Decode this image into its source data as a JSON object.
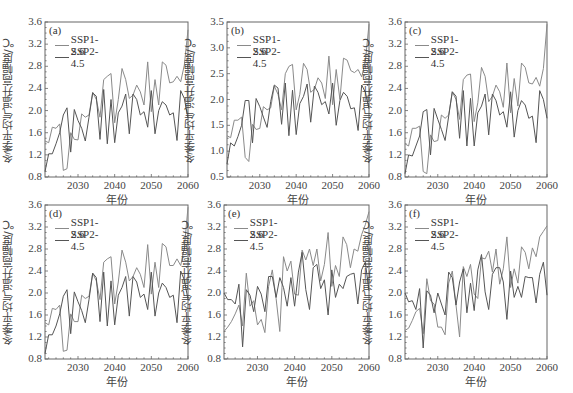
{
  "figure": {
    "xlabel": "年份",
    "ylabel": "冬季平均气温升高幅度/℃",
    "legend": [
      "SSP1-2.6",
      "SSP2-4.5"
    ],
    "line_colors": [
      "#8a8a8a",
      "#555555"
    ]
  },
  "chart_data": [
    {
      "panel": "(a)",
      "type": "line",
      "xlabel": "年份",
      "ylabel": "冬季平均气温升高幅度/℃",
      "xlim": [
        2021,
        2060
      ],
      "ylim": [
        0.8,
        3.6
      ],
      "xticks": [
        "2030",
        "2040",
        "2050",
        "2060"
      ],
      "yticks": [
        "0.8",
        "1.2",
        "1.6",
        "2.0",
        "2.4",
        "2.8",
        "3.2",
        "3.6"
      ],
      "x": [
        2021,
        2022,
        2023,
        2024,
        2025,
        2026,
        2027,
        2028,
        2029,
        2030,
        2031,
        2032,
        2033,
        2034,
        2035,
        2036,
        2037,
        2038,
        2039,
        2040,
        2041,
        2042,
        2043,
        2044,
        2045,
        2046,
        2047,
        2048,
        2049,
        2050,
        2051,
        2052,
        2053,
        2054,
        2055,
        2056,
        2057,
        2058,
        2059,
        2060
      ],
      "series": [
        {
          "name": "SSP1-2.6",
          "values": [
            1.45,
            1.42,
            1.7,
            1.68,
            1.76,
            0.92,
            0.95,
            1.6,
            1.48,
            1.47,
            1.94,
            1.88,
            1.92,
            2.33,
            2.2,
            1.88,
            2.56,
            2.62,
            2.67,
            1.78,
            2.2,
            2.76,
            2.56,
            2.22,
            2.28,
            2.46,
            2.34,
            2.1,
            2.88,
            1.98,
            2.56,
            2.1,
            2.88,
            2.82,
            2.5,
            2.52,
            2.62,
            2.52,
            2.82,
            3.46
          ]
        },
        {
          "name": "SSP2-4.5",
          "values": [
            0.9,
            1.22,
            1.22,
            1.4,
            1.6,
            1.92,
            2.05,
            1.25,
            2.02,
            1.82,
            1.68,
            1.45,
            1.88,
            2.32,
            2.26,
            1.48,
            2.38,
            1.4,
            2.2,
            1.42,
            1.96,
            2.08,
            2.3,
            1.58,
            2.3,
            2.2,
            1.92,
            1.98,
            1.7,
            2.36,
            1.58,
            2.0,
            2.16,
            2.1,
            1.92,
            1.96,
            1.46,
            2.36,
            2.22,
            1.86
          ]
        }
      ]
    },
    {
      "panel": "(b)",
      "type": "line",
      "xlabel": "年份",
      "ylabel": "冬季平均气温升高幅度/℃",
      "xlim": [
        2021,
        2060
      ],
      "ylim": [
        0.5,
        3.5
      ],
      "xticks": [
        "2030",
        "2040",
        "2050",
        "2060"
      ],
      "yticks": [
        "0.5",
        "1.0",
        "1.5",
        "2.0",
        "2.5",
        "3.0",
        "3.5"
      ],
      "x": [
        2021,
        2022,
        2023,
        2024,
        2025,
        2026,
        2027,
        2028,
        2029,
        2030,
        2031,
        2032,
        2033,
        2034,
        2035,
        2036,
        2037,
        2038,
        2039,
        2040,
        2041,
        2042,
        2043,
        2044,
        2045,
        2046,
        2047,
        2048,
        2049,
        2050,
        2051,
        2052,
        2053,
        2054,
        2055,
        2056,
        2057,
        2058,
        2059,
        2060
      ],
      "series": [
        {
          "name": "SSP1-2.6",
          "values": [
            1.3,
            1.26,
            1.6,
            1.6,
            1.66,
            0.88,
            0.8,
            1.52,
            1.42,
            1.44,
            1.86,
            1.8,
            1.84,
            2.26,
            2.1,
            1.8,
            2.5,
            2.64,
            2.68,
            1.8,
            2.1,
            2.7,
            2.58,
            2.14,
            2.2,
            2.42,
            2.32,
            2.02,
            2.84,
            1.9,
            2.58,
            2.0,
            2.8,
            2.76,
            2.56,
            2.52,
            2.58,
            2.44,
            2.74,
            3.46
          ]
        },
        {
          "name": "SSP2-4.5",
          "values": [
            0.75,
            1.16,
            1.1,
            1.28,
            1.5,
            1.98,
            1.98,
            1.16,
            2.02,
            1.86,
            1.66,
            1.46,
            1.96,
            2.28,
            2.22,
            1.52,
            2.32,
            1.3,
            2.18,
            1.32,
            1.92,
            2.06,
            2.3,
            1.56,
            2.26,
            2.14,
            1.9,
            1.96,
            1.72,
            2.32,
            1.5,
            1.98,
            2.14,
            2.06,
            1.82,
            1.84,
            1.4,
            2.28,
            2.14,
            1.82
          ]
        }
      ]
    },
    {
      "panel": "(c)",
      "type": "line",
      "xlabel": "年份",
      "ylabel": "冬季平均气温升高幅度/℃",
      "xlim": [
        2021,
        2060
      ],
      "ylim": [
        0.8,
        3.6
      ],
      "xticks": [
        "2030",
        "2040",
        "2050",
        "2060"
      ],
      "yticks": [
        "0.8",
        "1.2",
        "1.6",
        "2.0",
        "2.4",
        "2.8",
        "3.2",
        "3.6"
      ],
      "x": [
        2021,
        2022,
        2023,
        2024,
        2025,
        2026,
        2027,
        2028,
        2029,
        2030,
        2031,
        2032,
        2033,
        2034,
        2035,
        2036,
        2037,
        2038,
        2039,
        2040,
        2041,
        2042,
        2043,
        2044,
        2045,
        2046,
        2047,
        2048,
        2049,
        2050,
        2051,
        2052,
        2053,
        2054,
        2055,
        2056,
        2057,
        2058,
        2059,
        2060
      ],
      "series": [
        {
          "name": "SSP1-2.6",
          "values": [
            1.4,
            1.36,
            1.68,
            1.68,
            1.72,
            0.9,
            0.86,
            1.56,
            1.44,
            1.46,
            1.92,
            1.86,
            1.92,
            2.34,
            2.2,
            1.84,
            2.56,
            2.64,
            2.66,
            1.8,
            2.14,
            2.78,
            2.62,
            2.16,
            2.26,
            2.46,
            2.34,
            2.06,
            2.86,
            1.96,
            2.58,
            2.08,
            2.86,
            2.78,
            2.5,
            2.48,
            2.6,
            2.44,
            2.76,
            3.56
          ]
        },
        {
          "name": "SSP2-4.5",
          "values": [
            0.86,
            1.2,
            1.18,
            1.36,
            1.54,
            1.98,
            2.02,
            1.2,
            2.04,
            1.84,
            1.66,
            1.46,
            1.9,
            2.34,
            2.26,
            1.5,
            2.36,
            1.36,
            2.22,
            1.36,
            1.96,
            2.08,
            2.3,
            1.56,
            2.3,
            2.18,
            1.92,
            1.98,
            1.7,
            2.34,
            1.52,
            2.0,
            2.18,
            2.1,
            1.86,
            1.9,
            1.42,
            2.36,
            2.2,
            1.86
          ]
        }
      ]
    },
    {
      "panel": "(d)",
      "type": "line",
      "xlabel": "年份",
      "ylabel": "冬季平均气温升高幅度/℃",
      "xlim": [
        2021,
        2060
      ],
      "ylim": [
        0.8,
        3.6
      ],
      "xticks": [
        "2030",
        "2040",
        "2050",
        "2060"
      ],
      "yticks": [
        "0.8",
        "1.2",
        "1.6",
        "2.0",
        "2.4",
        "2.8",
        "3.2",
        "3.6"
      ],
      "x": [
        2021,
        2022,
        2023,
        2024,
        2025,
        2026,
        2027,
        2028,
        2029,
        2030,
        2031,
        2032,
        2033,
        2034,
        2035,
        2036,
        2037,
        2038,
        2039,
        2040,
        2041,
        2042,
        2043,
        2044,
        2045,
        2046,
        2047,
        2048,
        2049,
        2050,
        2051,
        2052,
        2053,
        2054,
        2055,
        2056,
        2057,
        2058,
        2059,
        2060
      ],
      "series": [
        {
          "name": "SSP1-2.6",
          "values": [
            1.46,
            1.42,
            1.72,
            1.7,
            1.78,
            0.94,
            0.96,
            1.62,
            1.48,
            1.48,
            1.96,
            1.9,
            1.94,
            2.36,
            2.22,
            1.88,
            2.56,
            2.62,
            2.66,
            1.8,
            2.2,
            2.78,
            2.56,
            2.22,
            2.3,
            2.46,
            2.34,
            2.1,
            2.88,
            1.98,
            2.56,
            2.1,
            2.9,
            2.84,
            2.5,
            2.5,
            2.62,
            2.5,
            2.82,
            3.56
          ]
        },
        {
          "name": "SSP2-4.5",
          "values": [
            0.9,
            1.24,
            1.24,
            1.4,
            1.62,
            1.94,
            2.06,
            1.26,
            2.02,
            1.84,
            1.68,
            1.46,
            1.88,
            2.36,
            2.28,
            1.48,
            2.38,
            1.4,
            2.22,
            1.42,
            1.96,
            2.1,
            2.3,
            1.58,
            2.3,
            2.2,
            1.92,
            1.98,
            1.7,
            2.38,
            1.58,
            2.0,
            2.18,
            2.1,
            1.92,
            1.96,
            1.46,
            2.4,
            2.24,
            1.88
          ]
        }
      ]
    },
    {
      "panel": "(e)",
      "type": "line",
      "xlabel": "年份",
      "ylabel": "冬季平均气温升高幅度/℃",
      "xlim": [
        2021,
        2060
      ],
      "ylim": [
        0.8,
        3.6
      ],
      "xticks": [
        "2030",
        "2040",
        "2050",
        "2060"
      ],
      "yticks": [
        "0.8",
        "1.2",
        "1.6",
        "2.0",
        "2.4",
        "2.8",
        "3.2",
        "3.6"
      ],
      "x": [
        2021,
        2022,
        2023,
        2024,
        2025,
        2026,
        2027,
        2028,
        2029,
        2030,
        2031,
        2032,
        2033,
        2034,
        2035,
        2036,
        2037,
        2038,
        2039,
        2040,
        2041,
        2042,
        2043,
        2044,
        2045,
        2046,
        2047,
        2048,
        2049,
        2050,
        2051,
        2052,
        2053,
        2054,
        2055,
        2056,
        2057,
        2058,
        2059,
        2060
      ],
      "series": [
        {
          "name": "SSP1-2.6",
          "values": [
            1.3,
            1.38,
            1.48,
            1.62,
            1.78,
            1.4,
            2.36,
            1.76,
            1.86,
            1.42,
            1.52,
            1.28,
            2.12,
            2.42,
            1.9,
            1.3,
            2.66,
            2.4,
            2.58,
            1.98,
            1.96,
            2.78,
            2.6,
            2.8,
            2.5,
            2.8,
            2.22,
            2.52,
            3.1,
            2.12,
            2.5,
            2.3,
            3.02,
            2.88,
            2.46,
            2.8,
            2.76,
            3.06,
            3.24,
            3.48
          ]
        },
        {
          "name": "SSP2-4.5",
          "values": [
            2.0,
            1.88,
            1.88,
            1.8,
            2.16,
            1.02,
            2.06,
            1.96,
            1.66,
            2.12,
            1.98,
            1.66,
            2.3,
            2.3,
            1.92,
            2.28,
            2.1,
            1.76,
            2.28,
            1.76,
            2.38,
            2.74,
            2.06,
            1.7,
            2.46,
            2.52,
            2.08,
            2.24,
            1.6,
            2.42,
            1.92,
            2.16,
            2.08,
            2.3,
            2.34,
            2.36,
            1.8,
            2.42,
            2.56,
            2.04
          ]
        }
      ]
    },
    {
      "panel": "(f)",
      "type": "line",
      "xlabel": "年份",
      "ylabel": "冬季平均气温升高幅度/℃",
      "xlim": [
        2021,
        2060
      ],
      "ylim": [
        0.8,
        3.6
      ],
      "xticks": [
        "2030",
        "2040",
        "2050",
        "2060"
      ],
      "yticks": [
        "0.8",
        "1.2",
        "1.6",
        "2.0",
        "2.4",
        "2.8",
        "3.2",
        "3.6"
      ],
      "x": [
        2021,
        2022,
        2023,
        2024,
        2025,
        2026,
        2027,
        2028,
        2029,
        2030,
        2031,
        2032,
        2033,
        2034,
        2035,
        2036,
        2037,
        2038,
        2039,
        2040,
        2041,
        2042,
        2043,
        2044,
        2045,
        2046,
        2047,
        2048,
        2049,
        2050,
        2051,
        2052,
        2053,
        2054,
        2055,
        2056,
        2057,
        2058,
        2059,
        2060
      ],
      "series": [
        {
          "name": "SSP1-2.6",
          "values": [
            1.32,
            1.36,
            1.5,
            1.66,
            1.72,
            1.26,
            2.26,
            1.86,
            1.8,
            1.38,
            1.38,
            1.24,
            2.18,
            2.4,
            1.78,
            1.2,
            2.48,
            2.3,
            2.52,
            1.98,
            1.9,
            2.64,
            2.62,
            2.76,
            2.38,
            2.8,
            2.16,
            2.44,
            3.02,
            2.1,
            2.44,
            2.18,
            2.84,
            2.74,
            2.44,
            2.82,
            2.66,
            3.02,
            3.12,
            3.22
          ]
        },
        {
          "name": "SSP2-4.5",
          "values": [
            2.0,
            1.84,
            1.86,
            1.7,
            2.08,
            1.0,
            2.04,
            1.96,
            1.64,
            2.0,
            1.8,
            1.6,
            2.38,
            2.28,
            1.78,
            2.2,
            2.44,
            1.64,
            2.18,
            1.68,
            2.42,
            2.7,
            2.02,
            1.7,
            2.34,
            2.46,
            2.46,
            2.2,
            1.52,
            2.4,
            1.92,
            2.12,
            1.92,
            2.3,
            2.28,
            2.28,
            1.82,
            2.34,
            2.56,
            1.96
          ]
        }
      ]
    }
  ]
}
